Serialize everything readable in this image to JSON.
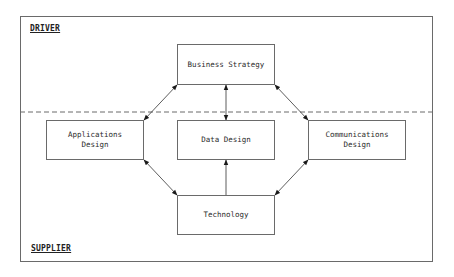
{
  "diagram": {
    "zones": {
      "upper": "DRIVER",
      "lower": "SUPPLIER"
    },
    "nodes": {
      "business_strategy": "Business Strategy",
      "applications_design": "Applications\nDesign",
      "data_design": "Data Design",
      "communications_design": "Communications\nDesign",
      "technology": "Technology"
    },
    "edges": [
      {
        "from": "Business Strategy",
        "to": "Applications Design",
        "type": "bidirectional"
      },
      {
        "from": "Business Strategy",
        "to": "Data Design",
        "type": "bidirectional"
      },
      {
        "from": "Business Strategy",
        "to": "Communications Design",
        "type": "bidirectional"
      },
      {
        "from": "Applications Design",
        "to": "Technology",
        "type": "bidirectional"
      },
      {
        "from": "Communications Design",
        "to": "Technology",
        "type": "bidirectional"
      },
      {
        "from": "Technology",
        "to": "Data Design",
        "type": "directed"
      }
    ],
    "divider": "dashed line separating DRIVER and SUPPLIER zones"
  }
}
